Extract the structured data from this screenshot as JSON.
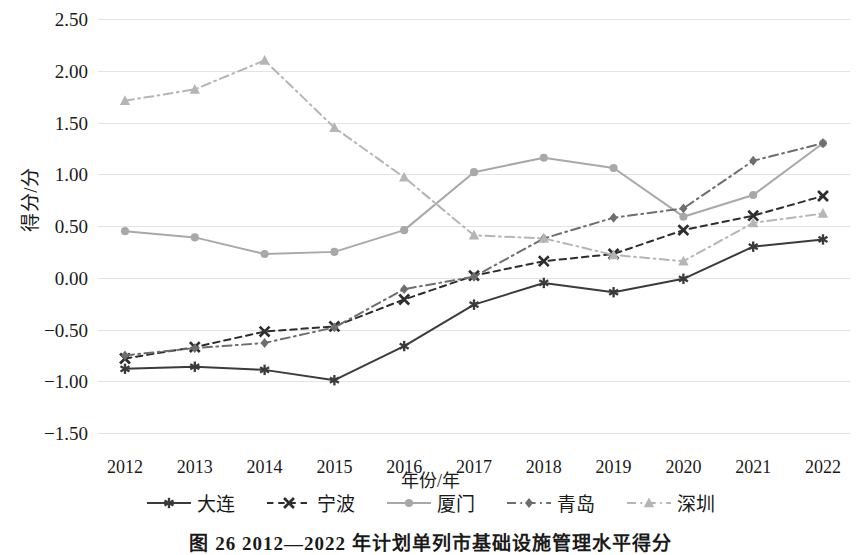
{
  "chart_data": {
    "type": "line",
    "title": "图 26  2012—2022 年计划单列市基础设施管理水平得分",
    "xlabel": "年份/年",
    "ylabel": "得分/分",
    "categories": [
      "2012",
      "2013",
      "2014",
      "2015",
      "2016",
      "2017",
      "2018",
      "2019",
      "2020",
      "2021",
      "2022"
    ],
    "ylim": [
      -1.5,
      2.5
    ],
    "ytick_labels": [
      "2.50",
      "2.00",
      "1.50",
      "1.00",
      "0.50",
      "0.00",
      "−0.50",
      "−1.00",
      "−1.50"
    ],
    "yticks": [
      2.5,
      2.0,
      1.5,
      1.0,
      0.5,
      0.0,
      -0.5,
      -1.0,
      -1.5
    ],
    "grid": true,
    "legend_position": "bottom",
    "series": [
      {
        "name": "大连",
        "marker": "asterisk",
        "line_style": "solid",
        "color": "#3b3b3b",
        "values": [
          -0.88,
          -0.86,
          -0.89,
          -0.99,
          -0.66,
          -0.26,
          -0.05,
          -0.14,
          -0.01,
          0.3,
          0.37
        ]
      },
      {
        "name": "宁波",
        "marker": "cross",
        "line_style": "dashed",
        "color": "#2e2e2e",
        "values": [
          -0.78,
          -0.67,
          -0.52,
          -0.47,
          -0.21,
          0.02,
          0.16,
          0.23,
          0.46,
          0.6,
          0.79
        ]
      },
      {
        "name": "厦门",
        "marker": "circle",
        "line_style": "solid",
        "color": "#a8a8a8",
        "values": [
          0.45,
          0.39,
          0.23,
          0.25,
          0.46,
          1.02,
          1.16,
          1.06,
          0.59,
          0.8,
          1.3
        ]
      },
      {
        "name": "青岛",
        "marker": "diamond",
        "line_style": "dashdot",
        "color": "#6e6e6e",
        "values": [
          -0.75,
          -0.68,
          -0.63,
          -0.48,
          -0.11,
          0.01,
          0.38,
          0.58,
          0.67,
          1.13,
          1.3
        ]
      },
      {
        "name": "深圳",
        "marker": "triangle",
        "line_style": "dashdot",
        "color": "#b5b5b5",
        "values": [
          1.71,
          1.82,
          2.1,
          1.45,
          0.97,
          0.41,
          0.38,
          0.22,
          0.16,
          0.53,
          0.62
        ]
      }
    ]
  },
  "figure": {
    "caption": "图 26  2012—2022 年计划单列市基础设施管理水平得分",
    "y_axis_title": "得分/分",
    "x_axis_title": "年份/年"
  }
}
